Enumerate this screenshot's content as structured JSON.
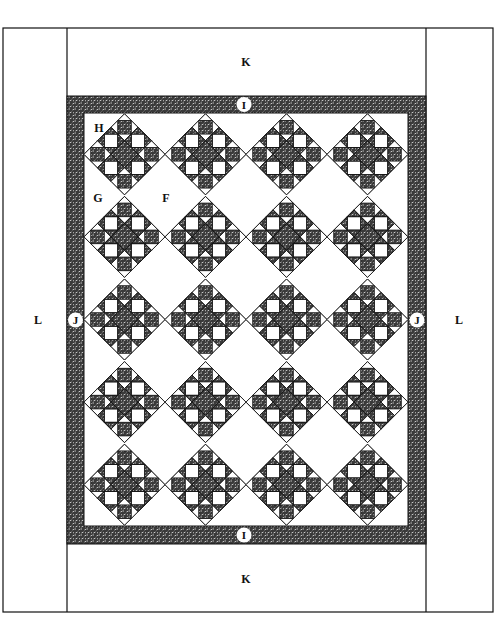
{
  "diagram": {
    "labels": {
      "top_border": "K",
      "bottom_border": "K",
      "left_border": "L",
      "right_border": "L",
      "top_inner_border": "I",
      "bottom_inner_border": "I",
      "left_inner_border": "J",
      "right_inner_border": "J",
      "block": "H",
      "side_triangle": "G",
      "setting_square": "F"
    },
    "grid": {
      "columns": 4,
      "rows": 5
    },
    "colors": {
      "line": "#111111",
      "fabric_dark": "#3a3a3a",
      "fabric_light": "#ffffff",
      "background": "#ffffff"
    }
  }
}
